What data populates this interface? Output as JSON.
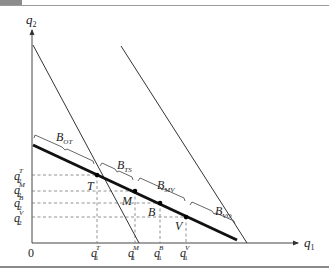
{
  "diagram": {
    "axes": {
      "y_label": "q",
      "y_label_sub": "2",
      "x_label": "q",
      "x_label_sub": "1",
      "origin_label": "0"
    },
    "points": [
      {
        "name": "T",
        "label": "T"
      },
      {
        "name": "M",
        "label": "M"
      },
      {
        "name": "B",
        "label": "B"
      },
      {
        "name": "V",
        "label": "V"
      }
    ],
    "y_ticks": [
      {
        "base": "q",
        "sub": "2",
        "sup": "T"
      },
      {
        "base": "q",
        "sub": "2",
        "sup": "M"
      },
      {
        "base": "q",
        "sub": "2",
        "sup": "B"
      },
      {
        "base": "q",
        "sub": "2",
        "sup": "V"
      }
    ],
    "x_ticks": [
      {
        "base": "q",
        "sub": "1",
        "sup": "T"
      },
      {
        "base": "q",
        "sub": "1",
        "sup": "M"
      },
      {
        "base": "q",
        "sub": "1",
        "sup": "B"
      },
      {
        "base": "q",
        "sub": "1",
        "sup": "V"
      }
    ],
    "segments": [
      {
        "base": "B",
        "sub": "OT"
      },
      {
        "base": "B",
        "sub": "TS"
      },
      {
        "base": "B",
        "sub": "MV"
      },
      {
        "base": "B",
        "sub": "VO"
      }
    ],
    "colors": {
      "line": "#333333",
      "thick_line": "#111111",
      "dashed": "#777777"
    }
  }
}
